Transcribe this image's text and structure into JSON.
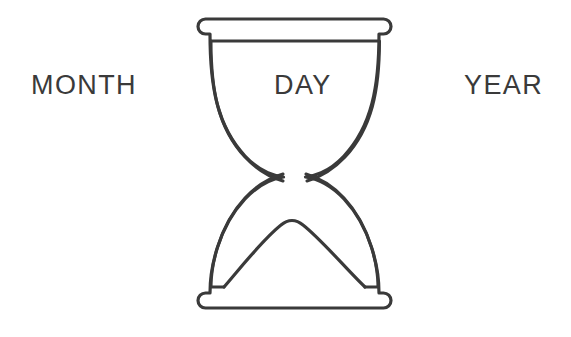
{
  "canvas": {
    "width": 571,
    "height": 337,
    "background_color": "#ffffff"
  },
  "illustration": {
    "name": "hourglass",
    "description": "Line-art hourglass with sand collected in the lower bulb",
    "stroke_color": "#3a3a3a",
    "fill_color": "#ffffff",
    "stroke_width": 3
  },
  "labels": {
    "month": {
      "text": "MONTH",
      "color": "#3a3a3a"
    },
    "day": {
      "text": "DAY",
      "color": "#3a3a3a"
    },
    "year": {
      "text": "YEAR",
      "color": "#3a3a3a"
    }
  }
}
